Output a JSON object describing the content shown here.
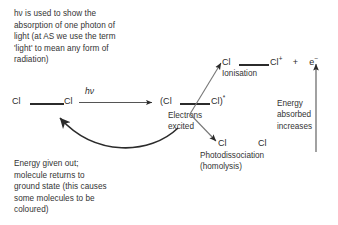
{
  "diagram": {
    "title_note": "hν is used to show the\nabsorption of one photon of\nlight (at AS we use the term\n'light' to mean any form of\nradiation)",
    "photon_label": "hν",
    "reactant": {
      "atom_left": "Cl",
      "atom_right": "Cl"
    },
    "excited_state": {
      "prefix": "(Cl",
      "suffix": "Cl)",
      "superscript": "*"
    },
    "excited_caption": "Electrons\nexcited",
    "ionisation": {
      "atom_left": "Cl",
      "atom_right": "Cl",
      "charge": "+",
      "plus": "+",
      "electron": "e",
      "electron_charge": "−",
      "label": "Ionisation"
    },
    "photodissociation": {
      "atom_left": "Cl",
      "atom_right": "Cl",
      "label": "Photodissociation\n(homolysis)"
    },
    "energy_axis_note": "Energy\nabsorbed\nincreases",
    "relaxation_note": "Energy given out;\nmolecule returns to\nground state (this causes\nsome molecules to be\ncoloured)"
  },
  "colors": {
    "ink": "#2b2b2b",
    "text": "#333333",
    "background": "#ffffff"
  }
}
